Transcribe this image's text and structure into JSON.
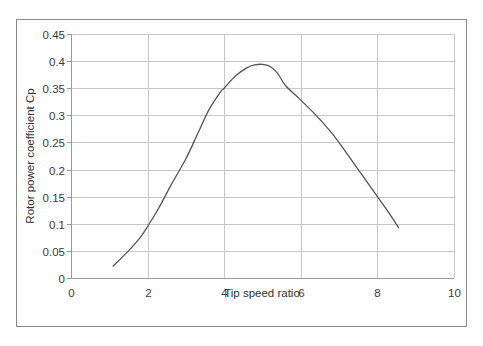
{
  "chart_data": {
    "type": "line",
    "title": "",
    "xlabel": "Tip speed ratio",
    "ylabel": "Rotor power coefficient Cp",
    "xlim": [
      0,
      10
    ],
    "ylim": [
      0,
      0.45
    ],
    "xticks": [
      0,
      2,
      4,
      6,
      8,
      10
    ],
    "xtick_labels": [
      "0",
      "2",
      "4",
      "6",
      "8",
      "10"
    ],
    "yticks": [
      0,
      0.05,
      0.1,
      0.15,
      0.2,
      0.25,
      0.3,
      0.35,
      0.4,
      0.45
    ],
    "ytick_labels": [
      "0",
      "0.05",
      "0.1",
      "0.15",
      "0.2",
      "0.25",
      "0.3",
      "0.35",
      "0.4",
      "0.45"
    ],
    "grid": true,
    "legend": null,
    "series": [
      {
        "name": "Cp",
        "color": "#555555",
        "x": [
          1.1,
          1.5,
          1.8,
          2.0,
          2.3,
          2.6,
          3.0,
          3.3,
          3.6,
          3.9,
          4.0,
          4.3,
          4.6,
          4.8,
          5.0,
          5.2,
          5.4,
          5.6,
          6.0,
          6.4,
          6.8,
          7.2,
          7.6,
          8.0,
          8.3,
          8.55
        ],
        "y": [
          0.022,
          0.05,
          0.074,
          0.095,
          0.13,
          0.17,
          0.22,
          0.265,
          0.31,
          0.343,
          0.35,
          0.373,
          0.388,
          0.393,
          0.394,
          0.39,
          0.377,
          0.355,
          0.328,
          0.3,
          0.268,
          0.23,
          0.19,
          0.15,
          0.12,
          0.093
        ]
      }
    ]
  },
  "colors": {
    "background": "#ffffff",
    "frame": "#8a8a8a",
    "grid": "#c8c8c8",
    "axis": "#9a9a9a",
    "line": "#555555"
  }
}
